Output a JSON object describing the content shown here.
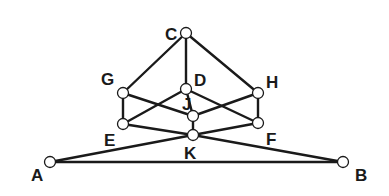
{
  "diagram": {
    "type": "graph",
    "colors": {
      "line": "#1a1a1a",
      "node_fill": "#ffffff",
      "background": "#ffffff"
    },
    "nodes": [
      {
        "id": "C",
        "x": 186,
        "y": 33,
        "label": "C",
        "lx": 165,
        "ly": 40
      },
      {
        "id": "G",
        "x": 123,
        "y": 93,
        "label": "G",
        "lx": 101,
        "ly": 85
      },
      {
        "id": "D",
        "x": 186,
        "y": 89,
        "label": "D",
        "lx": 194,
        "ly": 86
      },
      {
        "id": "H",
        "x": 258,
        "y": 93,
        "label": "H",
        "lx": 266,
        "ly": 88
      },
      {
        "id": "J",
        "x": 193,
        "y": 116,
        "label": "J",
        "lx": 182,
        "ly": 110
      },
      {
        "id": "E",
        "x": 123,
        "y": 124,
        "label": "E",
        "lx": 104,
        "ly": 146
      },
      {
        "id": "F",
        "x": 258,
        "y": 123,
        "label": "F",
        "lx": 266,
        "ly": 145
      },
      {
        "id": "K",
        "x": 193,
        "y": 135,
        "label": "K",
        "lx": 184,
        "ly": 159
      },
      {
        "id": "A",
        "x": 50,
        "y": 162,
        "label": "A",
        "lx": 31,
        "ly": 181
      },
      {
        "id": "B",
        "x": 343,
        "y": 162,
        "label": "B",
        "lx": 355,
        "ly": 181
      }
    ],
    "edges": [
      [
        "C",
        "G"
      ],
      [
        "C",
        "D"
      ],
      [
        "C",
        "H"
      ],
      [
        "G",
        "E"
      ],
      [
        "H",
        "F"
      ],
      [
        "G",
        "J"
      ],
      [
        "J",
        "H"
      ],
      [
        "D",
        "E"
      ],
      [
        "D",
        "F"
      ],
      [
        "D",
        "J"
      ],
      [
        "J",
        "K"
      ],
      [
        "E",
        "K"
      ],
      [
        "K",
        "F"
      ],
      [
        "A",
        "K"
      ],
      [
        "K",
        "B"
      ],
      [
        "A",
        "B"
      ]
    ]
  }
}
